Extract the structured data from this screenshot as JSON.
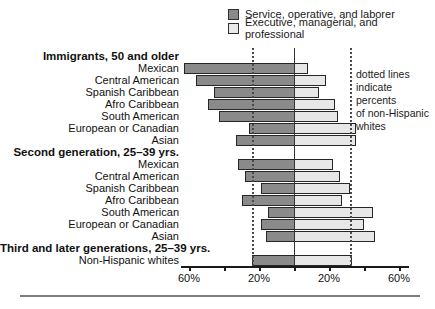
{
  "legend": {
    "items": [
      {
        "label": "Service, operative, and laborer",
        "color": "#8a8a8a"
      },
      {
        "label": "Executive, managerial, and professional",
        "color": "#e9e9e9"
      }
    ]
  },
  "annotation": {
    "lines": [
      "dotted lines",
      "indicate percents",
      "of non-Hispanic",
      "whites"
    ]
  },
  "chart_data": {
    "type": "bar",
    "orientation": "diverging-horizontal",
    "title": "",
    "xlabel": "",
    "ylabel": "",
    "xlim": [
      -64,
      64
    ],
    "grid": false,
    "legend_position": "top-right",
    "series_names": [
      "Service, operative, and laborer",
      "Executive, managerial, and professional"
    ],
    "unit": "%",
    "groups": [
      {
        "header": "Immigrants, 50 and older",
        "rows": [
          {
            "label": "Mexican",
            "service": 63,
            "executive": 7
          },
          {
            "label": "Central American",
            "service": 56,
            "executive": 17
          },
          {
            "label": "Spanish Caribbean",
            "service": 46,
            "executive": 13
          },
          {
            "label": "Afro Caribbean",
            "service": 49,
            "executive": 22
          },
          {
            "label": "South American",
            "service": 43,
            "executive": 24
          },
          {
            "label": "European or Canadian",
            "service": 26,
            "executive": 34
          },
          {
            "label": "Asian",
            "service": 33,
            "executive": 34
          }
        ]
      },
      {
        "header": "Second generation, 25–39 yrs.",
        "rows": [
          {
            "label": "Mexican",
            "service": 32,
            "executive": 21
          },
          {
            "label": "Central American",
            "service": 28,
            "executive": 25
          },
          {
            "label": "Spanish Caribbean",
            "service": 19,
            "executive": 31
          },
          {
            "label": "Afro Caribbean",
            "service": 30,
            "executive": 26
          },
          {
            "label": "South American",
            "service": 15,
            "executive": 44
          },
          {
            "label": "European or Canadian",
            "service": 19,
            "executive": 39
          },
          {
            "label": "Asian",
            "service": 16,
            "executive": 45
          }
        ]
      },
      {
        "header": "Third and later generations, 25–39 yrs.",
        "rows": [
          {
            "label": "Non-Hispanic whites",
            "service": 24,
            "executive": 32
          }
        ]
      }
    ],
    "reference_lines": {
      "note": "dotted lines indicate percents of non-Hispanic whites",
      "service": 24,
      "executive": 32
    },
    "axis": {
      "tick_values": [
        -60,
        -40,
        -20,
        0,
        20,
        40,
        60
      ],
      "tick_labels": [
        "60%",
        "",
        "20%",
        "",
        "20%",
        "",
        "60%"
      ]
    },
    "colors": {
      "service": "#8a8a8a",
      "executive": "#e7e7e7",
      "bar_border": "#262626"
    }
  }
}
